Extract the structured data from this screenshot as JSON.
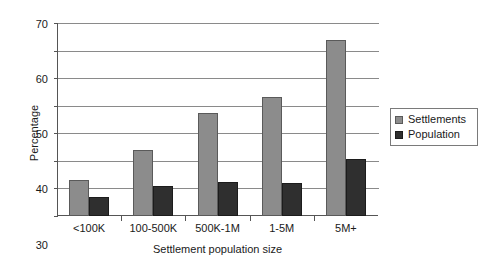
{
  "chart_data": {
    "type": "bar",
    "title": "",
    "xlabel": "Settlement population size",
    "ylabel": "Percentage",
    "categories": [
      "<100K",
      "100-500K",
      "500K-1M",
      "1-5M",
      "5M+"
    ],
    "series": [
      {
        "name": "Settlements",
        "color": "#8c8c8c",
        "values": [
          13,
          24,
          37.5,
          43,
          64
        ]
      },
      {
        "name": "Population",
        "color": "#2f2f2f",
        "values": [
          7,
          11,
          12.5,
          12,
          20.5
        ]
      }
    ],
    "ylim": [
      0,
      70
    ],
    "ytick_step": 10,
    "yticks": [
      "0",
      "10",
      "20",
      "30",
      "40",
      "50",
      "60",
      "70"
    ],
    "grid": "horizontal",
    "legend_position": "right"
  }
}
